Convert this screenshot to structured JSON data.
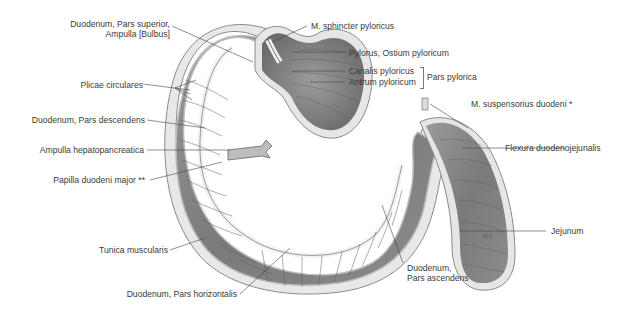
{
  "figure": {
    "type": "anatomical illustration",
    "signature": "H.S."
  },
  "labels": {
    "duodenum_pars_superior_1": "Duodenum, Pars superior,",
    "duodenum_pars_superior_2": "Ampulla [Bulbus]",
    "plicae_circulares": "Plicae circulares",
    "duodenum_pars_descendens": "Duodenum, Pars descendens",
    "ampulla_hepatopancreatica": "Ampulla hepatopancreatica",
    "papilla_duodeni_major": "Papilla duodeni major **",
    "tunica_muscularis": "Tunica muscularis",
    "duodenum_pars_horizontalis": "Duodenum, Pars horizontalis",
    "m_sphincter_pyloricus": "M. sphincter pyloricus",
    "pylorus_ostium": "Pylorus, Ostium pyloricum",
    "canalis_pyloricus": "Canalis pyloricus",
    "antrum_pyloricum": "Antrum pyloricum",
    "pars_pylorica": "Pars pylorica",
    "m_suspensorius_duodeni": "M. suspensorius duodeni *",
    "flexura_duodenojejunalis": "Flexura duodenojejunalis",
    "jejunum": "Jejunum",
    "duodenum_pars_ascendens_1": "Duodenum,",
    "duodenum_pars_ascendens_2": "Pars ascendens"
  },
  "colors": {
    "tissue_dark": "#6e6e6e",
    "tissue_mid": "#8f8f8f",
    "tissue_light": "#c9c9c9",
    "wall": "#e6e6e6",
    "leader": "#444444",
    "text": "#3a3a3a"
  }
}
